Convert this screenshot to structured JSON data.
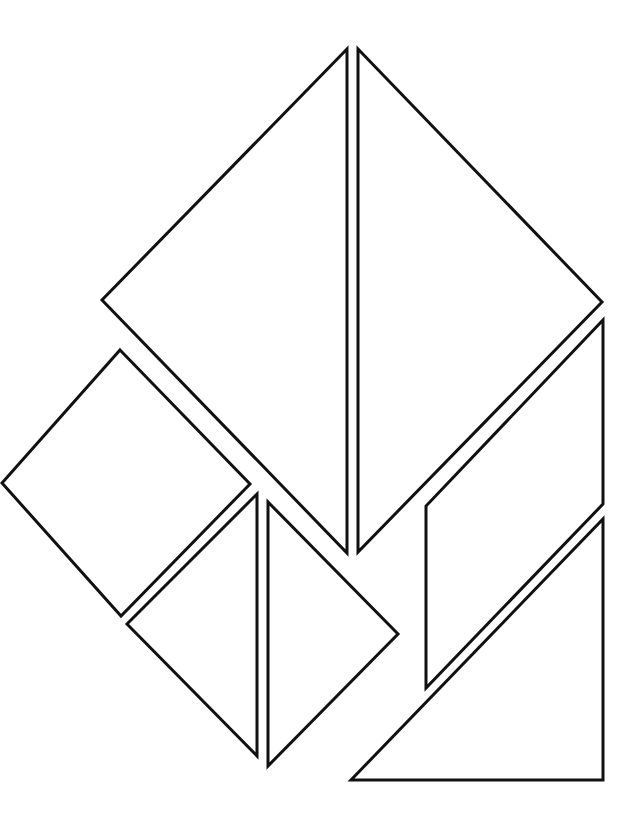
{
  "diagram": {
    "type": "tangram-template",
    "background": "#ffffff",
    "stroke_color": "#111111",
    "stroke_width": 3,
    "pieces": [
      {
        "id": "large-triangle-left",
        "shape": "triangle",
        "points": "347,49 102,300 347,553"
      },
      {
        "id": "large-triangle-right",
        "shape": "triangle",
        "points": "358,49 602,302 358,552"
      },
      {
        "id": "square",
        "shape": "square",
        "points": "120,350 250,484 121,616 2,483"
      },
      {
        "id": "small-triangle-left",
        "shape": "triangle",
        "points": "257,494 127,624 257,756"
      },
      {
        "id": "small-triangle-right",
        "shape": "triangle",
        "points": "268,502 398,634 268,766"
      },
      {
        "id": "parallelogram",
        "shape": "parallelogram",
        "points": "603,320 603,504 426,688 426,506"
      },
      {
        "id": "medium-triangle",
        "shape": "triangle",
        "points": "603,519 603,780 351,780"
      }
    ]
  }
}
